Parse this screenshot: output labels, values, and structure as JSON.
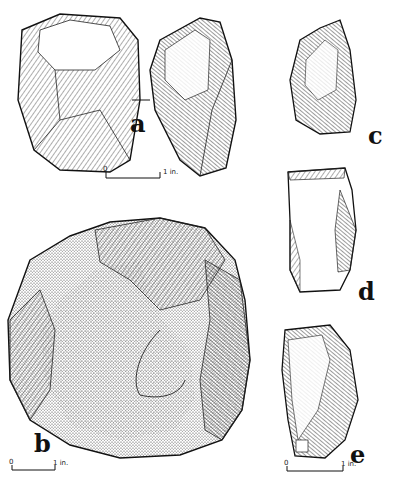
{
  "figure": {
    "artifacts": [
      {
        "id": "a",
        "label": "a",
        "description": "stone core, two views"
      },
      {
        "id": "b",
        "label": "b",
        "description": "large flaked cortex core"
      },
      {
        "id": "c",
        "label": "c",
        "description": "pointed flake"
      },
      {
        "id": "d",
        "label": "d",
        "description": "rectangular flake"
      },
      {
        "id": "e",
        "label": "e",
        "description": "flake with facets"
      }
    ],
    "scale_bars": [
      {
        "for": "a",
        "start": "0",
        "end": "1 in."
      },
      {
        "for": "b",
        "start": "0",
        "end": "1 in."
      },
      {
        "for": "e",
        "start": "0",
        "end": "1 in."
      }
    ]
  }
}
